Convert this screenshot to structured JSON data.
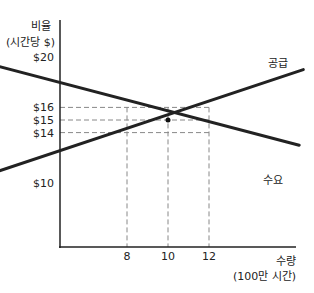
{
  "chart_data": {
    "type": "line",
    "title": "",
    "ylabel": [
      "비율",
      "(시간당 $)"
    ],
    "xlabel": [
      "수량",
      "(100만 시간)"
    ],
    "yticks": [
      {
        "v": 20,
        "label": "$20"
      },
      {
        "v": 16,
        "label": "$16"
      },
      {
        "v": 15,
        "label": "$15"
      },
      {
        "v": 14,
        "label": "$14"
      },
      {
        "v": 10,
        "label": "$10"
      }
    ],
    "xticks": [
      {
        "v": 8,
        "label": "8"
      },
      {
        "v": 10,
        "label": "10"
      },
      {
        "v": 12,
        "label": "12"
      }
    ],
    "series": [
      {
        "name": "공급",
        "points": [
          [
            0,
            10
          ],
          [
            16.6,
            19
          ]
        ]
      },
      {
        "name": "수요",
        "points": [
          [
            0,
            20
          ],
          [
            16.4,
            13
          ]
        ]
      }
    ],
    "equilibrium": {
      "x": 10,
      "y": 15
    },
    "reference_lines": [
      {
        "y": 16,
        "x": 12
      },
      {
        "y": 15,
        "x": 12
      },
      {
        "y": 14,
        "x": 12
      },
      {
        "x": 8
      },
      {
        "x": 10
      },
      {
        "x": 12
      }
    ],
    "grid": false
  }
}
